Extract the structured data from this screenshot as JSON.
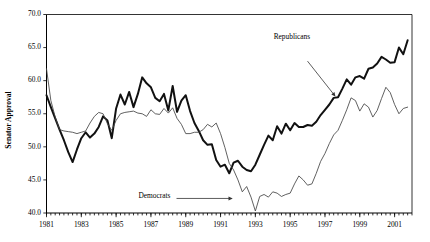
{
  "chart_data": {
    "type": "line",
    "title": "",
    "xlabel": "",
    "ylabel": "Senator Approval",
    "ylim": [
      40.0,
      70.0
    ],
    "xlim": [
      1981.0,
      2002.0
    ],
    "grid": false,
    "legend_position": "none",
    "y_ticks": [
      "70.0",
      "65.0",
      "60.0",
      "55.0",
      "50.0",
      "45.0",
      "40.0"
    ],
    "y_tick_values": [
      70.0,
      65.0,
      60.0,
      55.0,
      50.0,
      45.0,
      40.0
    ],
    "x_ticks": [
      "1981",
      "1983",
      "1985",
      "1987",
      "1989",
      "1991",
      "1993",
      "1995",
      "1997",
      "1999",
      "2001"
    ],
    "x_tick_values": [
      1981,
      1983,
      1985,
      1987,
      1989,
      1991,
      1993,
      1995,
      1997,
      1999,
      2001
    ],
    "x_minor_tick_interval": 0.25,
    "annotations": [
      {
        "text": "Republicans",
        "x": 1995.1,
        "y": 66.3,
        "arrow_to_x": 1997.6,
        "arrow_to_y": 57.6
      },
      {
        "text": "Democrats",
        "x": 1987.2,
        "y": 42.2,
        "arrow_to_x": 1991.7,
        "arrow_to_y": 42.2
      }
    ],
    "series": [
      {
        "name": "Republicans",
        "style": "thick-black",
        "color": "#111111",
        "x": [
          1981.0,
          1981.25,
          1981.5,
          1981.75,
          1982.0,
          1982.25,
          1982.5,
          1982.75,
          1983.0,
          1983.25,
          1983.5,
          1983.75,
          1984.0,
          1984.25,
          1984.5,
          1984.75,
          1985.0,
          1985.25,
          1985.5,
          1985.75,
          1986.0,
          1986.25,
          1986.5,
          1986.75,
          1987.0,
          1987.25,
          1987.5,
          1987.75,
          1988.0,
          1988.25,
          1988.5,
          1988.75,
          1989.0,
          1989.25,
          1989.5,
          1989.75,
          1990.0,
          1990.25,
          1990.5,
          1990.75,
          1991.0,
          1991.25,
          1991.5,
          1991.75,
          1992.0,
          1992.25,
          1992.5,
          1992.75,
          1993.0,
          1993.25,
          1993.5,
          1993.75,
          1994.0,
          1994.25,
          1994.5,
          1994.75,
          1995.0,
          1995.25,
          1995.5,
          1995.75,
          1996.0,
          1996.25,
          1996.5,
          1996.75,
          1997.0,
          1997.25,
          1997.5,
          1997.75,
          1998.0,
          1998.25,
          1998.5,
          1998.75,
          1999.0,
          1999.25,
          1999.5,
          1999.75,
          2000.0,
          2000.25,
          2000.5,
          2000.75,
          2001.0,
          2001.25,
          2001.5,
          2001.75
        ],
        "values": [
          57.8,
          56.0,
          54.3,
          52.6,
          51.0,
          49.2,
          47.7,
          49.6,
          51.3,
          52.2,
          51.4,
          52.0,
          53.0,
          54.6,
          54.0,
          51.3,
          55.8,
          57.9,
          56.4,
          58.3,
          56.0,
          58.0,
          60.5,
          59.6,
          59.0,
          57.4,
          56.9,
          58.0,
          55.5,
          59.2,
          55.3,
          57.0,
          57.8,
          55.4,
          53.6,
          52.4,
          51.0,
          50.3,
          50.4,
          48.0,
          47.0,
          47.3,
          46.0,
          47.6,
          47.9,
          47.0,
          46.5,
          46.3,
          47.3,
          48.8,
          50.3,
          51.7,
          51.0,
          53.1,
          52.0,
          53.5,
          52.5,
          53.6,
          53.0,
          53.0,
          53.3,
          53.2,
          53.8,
          54.8,
          55.6,
          56.4,
          57.4,
          57.5,
          58.8,
          60.2,
          59.4,
          60.5,
          60.7,
          60.3,
          61.8,
          62.0,
          62.6,
          63.6,
          63.2,
          62.7,
          62.8,
          65.0,
          64.0,
          66.1
        ]
      },
      {
        "name": "Democrats",
        "style": "thin-gray",
        "color": "#444444",
        "x": [
          1981.0,
          1981.25,
          1981.5,
          1981.75,
          1982.0,
          1982.25,
          1982.5,
          1982.75,
          1983.0,
          1983.25,
          1983.5,
          1983.75,
          1984.0,
          1984.25,
          1984.5,
          1984.75,
          1985.0,
          1985.25,
          1985.5,
          1985.75,
          1986.0,
          1986.25,
          1986.5,
          1986.75,
          1987.0,
          1987.25,
          1987.5,
          1987.75,
          1988.0,
          1988.25,
          1988.5,
          1988.75,
          1989.0,
          1989.25,
          1989.5,
          1989.75,
          1990.0,
          1990.25,
          1990.5,
          1990.75,
          1991.0,
          1991.25,
          1991.5,
          1991.75,
          1992.0,
          1992.25,
          1992.5,
          1992.75,
          1993.0,
          1993.25,
          1993.5,
          1993.75,
          1994.0,
          1994.25,
          1994.5,
          1994.75,
          1995.0,
          1995.25,
          1995.5,
          1995.75,
          1996.0,
          1996.25,
          1996.5,
          1996.75,
          1997.0,
          1997.25,
          1997.5,
          1997.75,
          1998.0,
          1998.25,
          1998.5,
          1998.75,
          1999.0,
          1999.25,
          1999.5,
          1999.75,
          2000.0,
          2000.25,
          2000.5,
          2000.75,
          2001.0,
          2001.25,
          2001.5,
          2001.75
        ],
        "values": [
          61.8,
          57.0,
          54.5,
          52.6,
          52.4,
          52.3,
          52.2,
          52.0,
          52.2,
          52.4,
          53.6,
          54.6,
          55.2,
          55.0,
          53.5,
          52.5,
          54.0,
          55.0,
          55.2,
          55.3,
          55.4,
          55.1,
          55.0,
          54.6,
          55.6,
          55.0,
          54.9,
          55.8,
          55.1,
          55.9,
          54.3,
          53.4,
          52.0,
          52.0,
          52.2,
          52.2,
          52.6,
          53.4,
          53.0,
          53.6,
          52.0,
          49.9,
          47.5,
          46.5,
          45.0,
          43.2,
          44.0,
          42.4,
          40.3,
          42.5,
          42.8,
          42.4,
          43.2,
          43.0,
          42.5,
          42.8,
          43.0,
          44.4,
          45.6,
          45.0,
          44.2,
          44.4,
          46.0,
          47.8,
          49.0,
          50.5,
          51.8,
          52.5,
          54.0,
          55.6,
          57.4,
          57.0,
          55.4,
          56.5,
          56.0,
          54.5,
          55.5,
          57.3,
          59.0,
          58.2,
          56.4,
          55.0,
          55.8,
          56.0
        ]
      }
    ]
  },
  "colors": {
    "republicans": "#111111",
    "democrats": "#444444",
    "axis": "#000000",
    "background": "#ffffff"
  }
}
